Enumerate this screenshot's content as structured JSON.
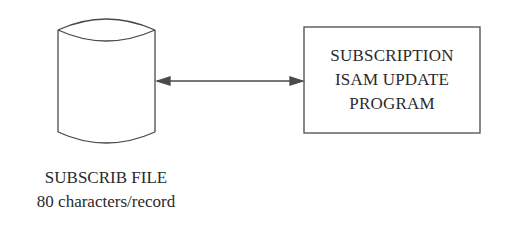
{
  "diagram": {
    "storage": {
      "shape": "cylinder",
      "name": "SUBSCRIB FILE",
      "description": "80 characters/record"
    },
    "process": {
      "shape": "rectangle",
      "lines": [
        "SUBSCRIPTION",
        "ISAM UPDATE",
        "PROGRAM"
      ]
    },
    "connector": {
      "type": "bidirectional-arrow",
      "from": "storage",
      "to": "process"
    },
    "colors": {
      "stroke": "#4a4a4a",
      "text": "#2a2a2a",
      "background": "#ffffff"
    }
  }
}
